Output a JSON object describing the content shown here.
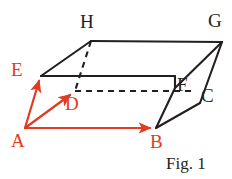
{
  "figure": {
    "caption": "Fig. 1",
    "colors": {
      "edge_black": "#231f20",
      "vector_red": "#e23b22",
      "background": "#ffffff"
    },
    "labels": [
      {
        "name": "vertex-label-h",
        "text": "H",
        "color": "black",
        "x": 80,
        "y": 12
      },
      {
        "name": "vertex-label-g",
        "text": "G",
        "color": "black",
        "x": 208,
        "y": 11
      },
      {
        "name": "vertex-label-e",
        "text": "E",
        "color": "red",
        "x": 11,
        "y": 60
      },
      {
        "name": "vertex-label-f",
        "text": "F",
        "color": "black",
        "x": 177,
        "y": 75
      },
      {
        "name": "vertex-label-c",
        "text": "C",
        "color": "black",
        "x": 201,
        "y": 86
      },
      {
        "name": "vertex-label-d",
        "text": "D",
        "color": "red",
        "x": 65,
        "y": 94
      },
      {
        "name": "vertex-label-a",
        "text": "A",
        "color": "red",
        "x": 11,
        "y": 131
      },
      {
        "name": "vertex-label-b",
        "text": "B",
        "color": "red",
        "x": 150,
        "y": 132
      }
    ],
    "vertices": {
      "A": {
        "x": 25,
        "y": 128
      },
      "B": {
        "x": 156,
        "y": 128
      },
      "C": {
        "x": 200,
        "y": 103
      },
      "D": {
        "x": 75,
        "y": 91
      },
      "E": {
        "x": 41,
        "y": 76
      },
      "F": {
        "x": 175,
        "y": 88
      },
      "G": {
        "x": 222,
        "y": 42
      },
      "H": {
        "x": 91,
        "y": 41
      }
    },
    "solid_edges": [
      {
        "name": "edge-e-h",
        "from": "E",
        "to": "H"
      },
      {
        "name": "edge-h-g",
        "from": "H",
        "to": "G"
      },
      {
        "name": "edge-e-f",
        "from": "E",
        "to": "F"
      },
      {
        "name": "edge-f-g",
        "from": "F",
        "to": "G"
      },
      {
        "name": "edge-g-c",
        "from": "G",
        "to": "C"
      },
      {
        "name": "edge-c-b",
        "from": "C",
        "to": "B"
      },
      {
        "name": "edge-f-b",
        "from": "F",
        "to": "B"
      }
    ],
    "dashed_edges": [
      {
        "name": "edge-h-d-hidden",
        "from": "H",
        "to": "D"
      },
      {
        "name": "edge-d-c-hidden",
        "from": "D",
        "to": "C"
      }
    ],
    "vectors": [
      {
        "name": "vector-a-b",
        "from": "A",
        "to": "B"
      },
      {
        "name": "vector-a-d",
        "from": "A",
        "to": "D"
      },
      {
        "name": "vector-a-e",
        "from": "A",
        "to": "E"
      }
    ]
  }
}
